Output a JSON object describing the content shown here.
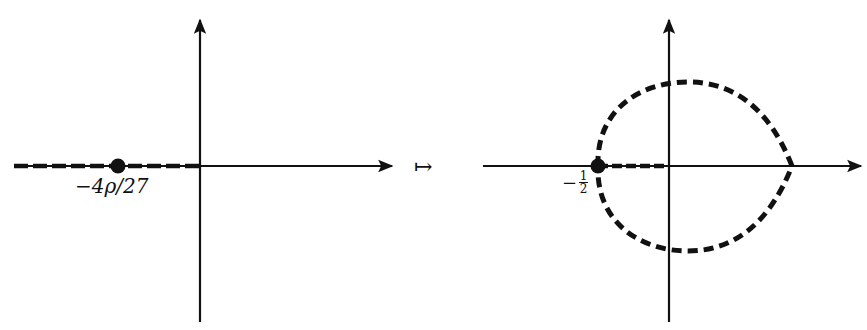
{
  "left_panel": {
    "point_label": "−4ρ/27",
    "description": "real-axis slit (dashed) from −∞ to 0 with marked point"
  },
  "mapsto_symbol": "↦",
  "right_panel": {
    "point_label_minus": "−",
    "point_label_num": "1",
    "point_label_den": "2",
    "description": "dashed closed curve through −1/2 with dashed slit to origin"
  },
  "colors": {
    "ink": "#111111",
    "background": "#ffffff"
  }
}
